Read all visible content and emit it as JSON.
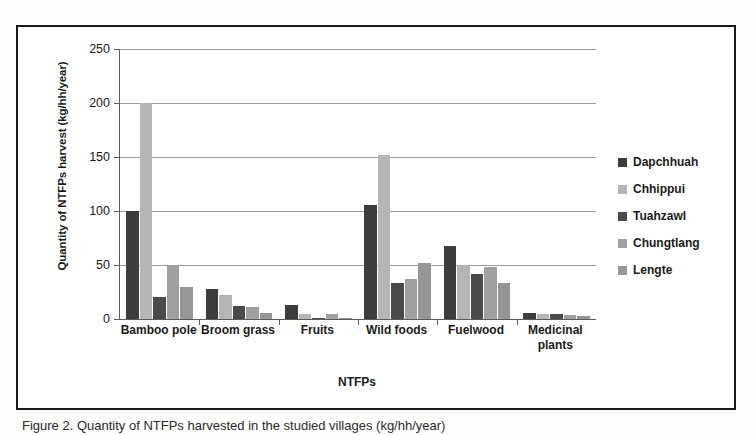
{
  "figure": {
    "caption": "Figure 2. Quantity of NTFPs harvested in the studied villages (kg/hh/year)"
  },
  "chart_data": {
    "type": "bar",
    "title": "",
    "xlabel": "NTFPs",
    "ylabel": "Quantity of NTFPs harvest (kg/hh/year)",
    "ylim": [
      0,
      250
    ],
    "yticks": [
      0,
      50,
      100,
      150,
      200,
      250
    ],
    "grid": true,
    "legend_position": "right",
    "categories": [
      "Bamboo pole",
      "Broom grass",
      "Fruits",
      "Wild foods",
      "Fuelwood",
      "Medicinal plants"
    ],
    "series": [
      {
        "name": "Dapchhuah",
        "color": "#3d3d3d",
        "values": [
          100,
          28,
          13,
          106,
          68,
          6
        ]
      },
      {
        "name": "Chhippui",
        "color": "#b5b5b5",
        "values": [
          200,
          22,
          5,
          152,
          50,
          5
        ]
      },
      {
        "name": "Tuahzawl",
        "color": "#4a4a4a",
        "values": [
          20,
          12,
          1,
          33,
          42,
          5
        ]
      },
      {
        "name": "Chungtlang",
        "color": "#a0a0a0",
        "values": [
          50,
          11,
          5,
          37,
          48,
          4
        ]
      },
      {
        "name": "Lengte",
        "color": "#969696",
        "values": [
          30,
          6,
          1,
          52,
          33,
          3
        ]
      }
    ]
  }
}
